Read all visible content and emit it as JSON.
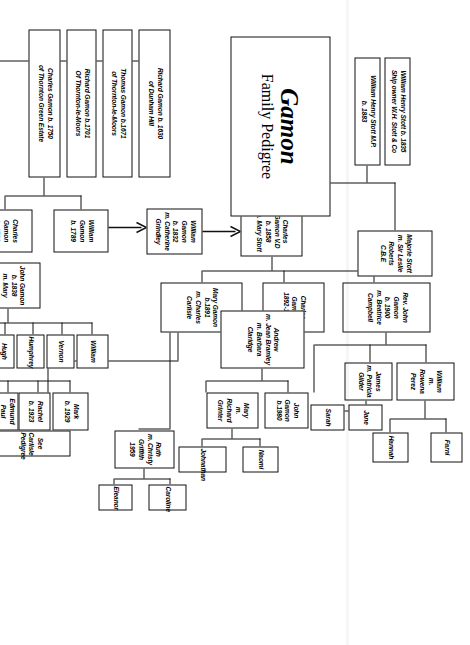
{
  "title": {
    "surname": "Gamon",
    "subtitle": "Family Pedigree"
  },
  "boxes": {
    "richard_1630": "Richard Gamon b. 1630\nof Dunham Hill",
    "thomas_1671": "Thomas Gamon b.1671\nof Thornton-le-Moors",
    "richard_1701": "Richard Gamon b.1701\nOf Thornton-le-Moors",
    "charles_1750": "Charles Gamon b. 1750\nof Thornton Green Estate",
    "william_1789": "William Gamon\nb. 1789",
    "charles_1783": "Charles\nGamon\nh. 1783",
    "john_1838": "John Gamon\nb. 1838\nm. Mary Vernon",
    "william_1832": "William Gamon\nb. 1832\nm. Catherine Grindley",
    "charles_vd_1858": "Charles Gamon V.D\nb. 1858\nm. Mary Stott",
    "wh_stott_1835": "William Henry Stott b. 1835\nShip owner W.H. Stott & Co",
    "wh_stott_mp": "William Henry Stott M.P.\nb. 1883",
    "majorie_stott": "Majorie Stott\nm. Sir Leslie Roberts\nC.B.E",
    "rev_john_1900": "Rev. John Gamon\nb. 1900\nm. Beatrice Campbell",
    "charles_1892": "Charles\nGamon\n1892-1939",
    "mary_1891": "Mary Gamon\nb.1891\nm. Charles Carlisle",
    "william_rowena": "William\nm.\nRowena\nPerez",
    "james_patricia": "James\nm. Patricia\nGilder",
    "andrew": "Andrew\nm. Jean Bramley\nm. Barbara Claridge",
    "farni": "Farni",
    "hannah": "Hannah",
    "jane": "Jane",
    "sarah": "Sarah",
    "john_1980": "John\nGamon\nb.1980",
    "mary_grinter": "Mary\nm. Richard\nGrinter",
    "naomi": "Naomi",
    "johnathan": "Johnathan",
    "geoffrey_1880": "Geoffrey\nb. 1880",
    "hugh": "Hugh",
    "humphrey": "Humphrey",
    "vernon": "Vernon",
    "william_child": "William",
    "sylvia_1920": "Sylvia\nb. 1920",
    "edmund_paul_1922": "Edmund Paul\nb. 1922",
    "rachel_1923": "Rachel\nb. 1923",
    "mark_1929": "Mark\nb. 1929",
    "see_carlisle": "See Carlisle Pedigree",
    "ruth": "Ruth\nm. Christy\nGriffith 1959",
    "eleanor": "Eleanor",
    "caroline": "Caroline"
  },
  "colors": {
    "ink": "#111111",
    "paper": "#ffffff"
  }
}
